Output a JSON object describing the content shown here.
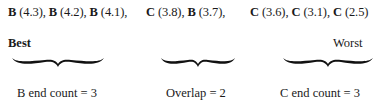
{
  "sequence": {
    "group1": "B (4.3), B (4.2), B (4.1),",
    "group2": "C (3.8), B (3.7),",
    "group3": "C (3.6), C (3.1), C (2.5)"
  },
  "labels": {
    "best": "Best",
    "worst": "Worst"
  },
  "captions": {
    "b_end": "B end count = 3",
    "overlap": "Overlap = 2",
    "c_end": "C end count = 3"
  }
}
